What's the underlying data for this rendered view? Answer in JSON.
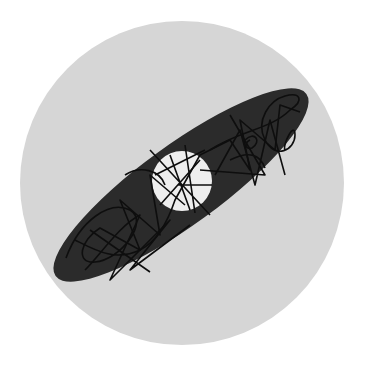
{
  "diagram": {
    "colors": {
      "page_background": "#ffffff",
      "disc": "#d6d6d6",
      "ellipse": "#2b2b2b",
      "center_circle": "#eeeeee",
      "orbit_lines": "#0e0e0e"
    },
    "disc": {
      "cx": 182,
      "cy": 183,
      "r": 162
    },
    "ellipse": {
      "cx": 181,
      "cy": 185,
      "rx": 155,
      "ry": 40,
      "rotation_deg": -36
    },
    "center_circle": {
      "cx": 182,
      "cy": 181,
      "r": 30
    }
  }
}
